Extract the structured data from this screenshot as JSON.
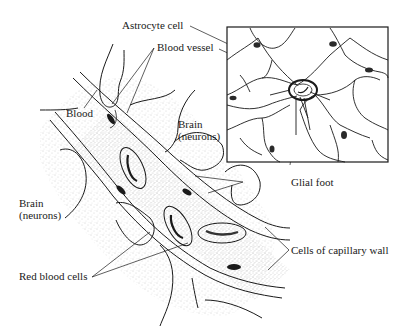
{
  "diagram": {
    "type": "labeled scientific illustration",
    "labels": {
      "astrocyte_cell": "Astrocyte cell",
      "blood_vessel": "Blood vessel",
      "blood": "Blood",
      "brain_upper": "Brain\n(neurons)",
      "brain_lower": "Brain\n(neurons)",
      "glial_foot": "Glial foot",
      "red_blood_cells": "Red blood cells",
      "cells_of_capillary_wall": "Cells of capillary wall"
    },
    "colors": {
      "ink": "#1a1a1a",
      "background": "#ffffff",
      "stipple": "#9a9a9a"
    },
    "panels": [
      {
        "name": "main-cross-section",
        "description": "Diagonal capillary running from upper-left to lower-right with red blood cells, endothelial cells and surrounding glial feet"
      },
      {
        "name": "inset-astrocyte",
        "description": "Boxed inset showing astrocyte network wrapping a central blood vessel"
      }
    ]
  }
}
